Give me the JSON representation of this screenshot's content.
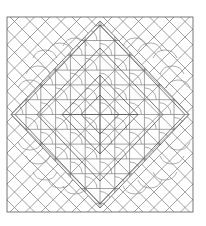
{
  "artwork": {
    "type": "geometric-coloring-pattern",
    "stroke_color": "#7a7a7a",
    "background": "#ffffff",
    "frame": {
      "x": 7,
      "y": 17,
      "width": 186,
      "height": 195
    },
    "elements": [
      "outer-square-frame",
      "inner-diamond-double-border",
      "corner-diagonal-lattice",
      "corner-arc-motifs",
      "center-grid",
      "nested-center-diamonds"
    ]
  }
}
